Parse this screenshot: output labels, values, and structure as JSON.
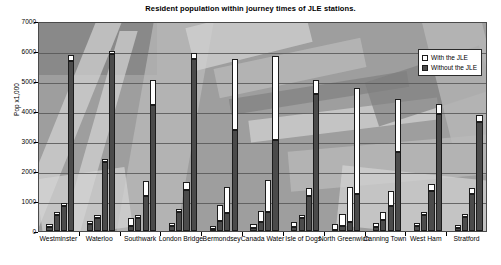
{
  "chart_data": {
    "type": "bar",
    "title": "Resident population within journey times of JLE stations.",
    "xlabel": "",
    "ylabel": "Pop x1,000",
    "ylim": [
      0,
      7000
    ],
    "yticks": [
      0,
      1000,
      2000,
      3000,
      4000,
      5000,
      6000,
      7000
    ],
    "grid": true,
    "legend_position": "top-right",
    "stacked": true,
    "bars_per_group": 4,
    "series": [
      {
        "name": "Without the JLE",
        "color": "#4b4b4b"
      },
      {
        "name": "With the JLE",
        "color": "#ffffff"
      }
    ],
    "categories": [
      "Westminster",
      "Waterloo",
      "Southwark",
      "London Bridge",
      "Bermondsey",
      "Canada Water",
      "Isle of Dogs",
      "North Greenwich",
      "Canning Town",
      "West Ham",
      "Stratford"
    ],
    "groups": [
      {
        "category": "Westminster",
        "bars": [
          {
            "without": 150,
            "with": 220
          },
          {
            "without": 520,
            "with": 560
          },
          {
            "without": 830,
            "with": 940
          },
          {
            "without": 5680,
            "with": 5870
          }
        ]
      },
      {
        "category": "Waterloo",
        "bars": [
          {
            "without": 240,
            "with": 300
          },
          {
            "without": 440,
            "with": 470
          },
          {
            "without": 2300,
            "with": 2380
          },
          {
            "without": 5900,
            "with": 5960
          }
        ]
      },
      {
        "category": "Southwark",
        "bars": [
          {
            "without": 180,
            "with": 420
          },
          {
            "without": 430,
            "with": 520
          },
          {
            "without": 1180,
            "with": 1680
          },
          {
            "without": 4200,
            "with": 5020
          }
        ]
      },
      {
        "category": "London Bridge",
        "bars": [
          {
            "without": 160,
            "with": 210
          },
          {
            "without": 620,
            "with": 700
          },
          {
            "without": 1380,
            "with": 1620
          },
          {
            "without": 5720,
            "with": 5950
          }
        ]
      },
      {
        "category": "Bermondsey",
        "bars": [
          {
            "without": 60,
            "with": 180
          },
          {
            "without": 320,
            "with": 880
          },
          {
            "without": 600,
            "with": 1480
          },
          {
            "without": 3380,
            "with": 5740
          }
        ]
      },
      {
        "category": "Canada Water",
        "bars": [
          {
            "without": 90,
            "with": 240
          },
          {
            "without": 300,
            "with": 660
          },
          {
            "without": 640,
            "with": 1700
          },
          {
            "without": 3050,
            "with": 5840
          }
        ]
      },
      {
        "category": "Isle of Dogs",
        "bars": [
          {
            "without": 120,
            "with": 300
          },
          {
            "without": 420,
            "with": 460
          },
          {
            "without": 1180,
            "with": 1420
          },
          {
            "without": 4560,
            "with": 5020
          }
        ]
      },
      {
        "category": "North Greenwich",
        "bars": [
          {
            "without": 40,
            "with": 220
          },
          {
            "without": 180,
            "with": 560
          },
          {
            "without": 300,
            "with": 1460
          },
          {
            "without": 1220,
            "with": 4760
          }
        ]
      },
      {
        "category": "Canning Town",
        "bars": [
          {
            "without": 120,
            "with": 260
          },
          {
            "without": 380,
            "with": 640
          },
          {
            "without": 820,
            "with": 1320
          },
          {
            "without": 2620,
            "with": 4400
          }
        ]
      },
      {
        "category": "West Ham",
        "bars": [
          {
            "without": 170,
            "with": 230
          },
          {
            "without": 520,
            "with": 640
          },
          {
            "without": 1320,
            "with": 1560
          },
          {
            "without": 3900,
            "with": 4220
          }
        ]
      },
      {
        "category": "Stratford",
        "bars": [
          {
            "without": 110,
            "with": 160
          },
          {
            "without": 480,
            "with": 560
          },
          {
            "without": 1240,
            "with": 1420
          },
          {
            "without": 3620,
            "with": 3860
          }
        ]
      }
    ]
  },
  "legend": {
    "with_label": "With the JLE",
    "without_label": "Without the JLE"
  }
}
